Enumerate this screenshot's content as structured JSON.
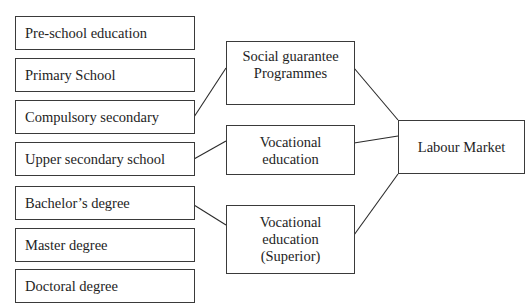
{
  "diagram": {
    "education_levels": [
      {
        "label": "Pre-school education"
      },
      {
        "label": "Primary School"
      },
      {
        "label": "Compulsory secondary"
      },
      {
        "label": "Upper secondary school"
      },
      {
        "label": "Bachelor’s degree"
      },
      {
        "label": "Master degree"
      },
      {
        "label": "Doctoral degree"
      }
    ],
    "pathways": [
      {
        "lines": [
          "Social guarantee",
          "Programmes"
        ]
      },
      {
        "lines": [
          "Vocational",
          "education"
        ]
      },
      {
        "lines": [
          "Vocational",
          "education",
          "(Superior)"
        ]
      }
    ],
    "destination": {
      "label": "Labour Market"
    },
    "connections": [
      {
        "from": "Compulsory secondary",
        "to": "Social guarantee Programmes"
      },
      {
        "from": "Upper secondary school",
        "to": "Vocational education"
      },
      {
        "from": "Bachelor’s degree",
        "to": "Vocational education (Superior)"
      },
      {
        "from": "Social guarantee Programmes",
        "to": "Labour Market"
      },
      {
        "from": "Vocational education",
        "to": "Labour Market"
      },
      {
        "from": "Vocational education (Superior)",
        "to": "Labour Market"
      }
    ]
  }
}
